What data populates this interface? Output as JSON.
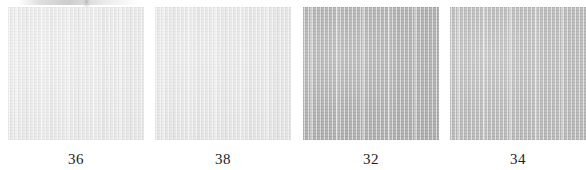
{
  "figure": {
    "type": "textile-swatch-row",
    "background_color": "#ffffff",
    "label_color": "#1d1d1d",
    "artifact": {
      "name": "scan-artifact",
      "visible": true
    },
    "swatches": [
      {
        "label": "36",
        "color": "#e8e8e8",
        "left": 8,
        "top": 7,
        "width": 136,
        "height": 133
      },
      {
        "label": "38",
        "color": "#e4e4e4",
        "left": 155,
        "top": 7,
        "width": 136,
        "height": 133
      },
      {
        "label": "32",
        "color": "#a8a8a8",
        "left": 303,
        "top": 7,
        "width": 136,
        "height": 133
      },
      {
        "label": "34",
        "color": "#b4b4b4",
        "left": 450,
        "top": 7,
        "width": 136,
        "height": 133
      }
    ]
  }
}
